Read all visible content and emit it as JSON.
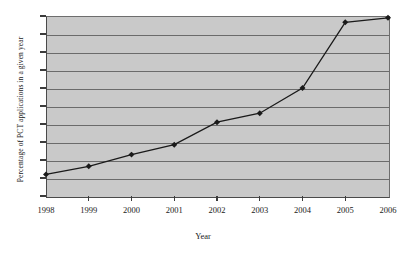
{
  "chart_data": {
    "type": "line",
    "title": "",
    "xlabel": "Year",
    "ylabel": "Percentage of PCT applications in a given year",
    "categories": [
      "1998",
      "1999",
      "2000",
      "2001",
      "2002",
      "2003",
      "2004",
      "2005",
      "2006"
    ],
    "x": [
      1998,
      1999,
      2000,
      2001,
      2002,
      2003,
      2004,
      2005,
      2006
    ],
    "values": [
      7.4,
      8.3,
      9.6,
      10.7,
      13.2,
      14.2,
      17.0,
      24.3,
      24.8
    ],
    "series": [
      {
        "name": "Percentage of PCT applications in a given year",
        "values": [
          7.4,
          8.3,
          9.6,
          10.7,
          13.2,
          14.2,
          17.0,
          24.3,
          24.8
        ]
      }
    ],
    "ylim": [
      5,
      25
    ],
    "xlim": [
      1998,
      2006
    ],
    "ytick_labels": [
      "5",
      "7",
      "9",
      "11",
      "13",
      "15",
      "17",
      "19",
      "21",
      "23",
      "25"
    ],
    "yticks": [
      5,
      7,
      9,
      11,
      13,
      15,
      17,
      19,
      21,
      23,
      25
    ],
    "xtick_labels": [
      "1998",
      "1999",
      "2000",
      "2001",
      "2002",
      "2003",
      "2004",
      "2005",
      "2006"
    ],
    "grid": true,
    "grid_axis": "y",
    "legend": false,
    "legend_position": "none",
    "marker": "filled-diamond",
    "line_color": "#1a1a1a",
    "marker_color": "#1a1a1a",
    "plot_background_color": "#c9c9c9",
    "gridline_color": "#6b6b6b",
    "figure_background_color": "#ffffff"
  }
}
